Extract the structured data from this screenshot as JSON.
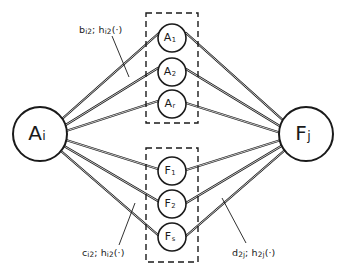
{
  "diagram": {
    "type": "node-link-graph",
    "background_color": "#ffffff",
    "stroke_color": "#1a1a1a",
    "source_node": {
      "id": "A_i",
      "base": "A",
      "subscript": "i",
      "cx": 40,
      "cy": 134,
      "r": 27
    },
    "sink_node": {
      "id": "F_j",
      "base": "F",
      "subscript": "j",
      "cx": 306,
      "cy": 134,
      "r": 27
    },
    "groups": [
      {
        "name": "a-group",
        "box": {
          "x": 146,
          "y": 13,
          "width": 52,
          "height": 110
        },
        "nodes": [
          {
            "id": "A_1",
            "base": "A",
            "subscript": "1",
            "cx": 172,
            "cy": 38,
            "r": 14
          },
          {
            "id": "A_2",
            "base": "A",
            "subscript": "2",
            "cx": 172,
            "cy": 72,
            "r": 14
          },
          {
            "id": "A_r",
            "base": "A",
            "subscript": "r",
            "cx": 172,
            "cy": 104,
            "r": 14
          }
        ]
      },
      {
        "name": "f-group",
        "box": {
          "x": 146,
          "y": 148,
          "width": 52,
          "height": 114
        },
        "nodes": [
          {
            "id": "F_1",
            "base": "F",
            "subscript": "1",
            "cx": 172,
            "cy": 171,
            "r": 14
          },
          {
            "id": "F_2",
            "base": "F",
            "subscript": "2",
            "cx": 172,
            "cy": 204,
            "r": 14
          },
          {
            "id": "F_s",
            "base": "F",
            "subscript": "s",
            "cx": 172,
            "cy": 237,
            "r": 14
          }
        ]
      }
    ],
    "annotations": [
      {
        "name": "b-annotation",
        "text": "b",
        "sub1": "i2",
        "mid": "; h",
        "sub2": "i2",
        "tail": "(·)",
        "x": 79,
        "y": 24,
        "leader": {
          "x1": 112,
          "y1": 36,
          "x2": 129,
          "y2": 77
        }
      },
      {
        "name": "c-annotation",
        "text": "c",
        "sub1": "i2",
        "mid": "; h",
        "sub2": "i2",
        "tail": "(·)",
        "x": 82,
        "y": 247,
        "leader": {
          "x1": 119,
          "y1": 245,
          "x2": 135,
          "y2": 203
        }
      },
      {
        "name": "d-annotation",
        "text": "d",
        "sub1": "2j",
        "mid": "; h",
        "sub2": "2j",
        "tail": "(·)",
        "x": 232,
        "y": 247,
        "leader": {
          "x1": 246,
          "y1": 243,
          "x2": 222,
          "y2": 198
        }
      }
    ],
    "edges": [
      {
        "name": "edge-ai-a1",
        "x1": 62,
        "y1": 119,
        "x2": 159,
        "y2": 33
      },
      {
        "name": "edge-ai-a2",
        "x1": 64,
        "y1": 126,
        "x2": 158,
        "y2": 68
      },
      {
        "name": "edge-ai-ar",
        "x1": 66,
        "y1": 131,
        "x2": 158,
        "y2": 101
      },
      {
        "name": "edge-ai-f1",
        "x1": 66,
        "y1": 140,
        "x2": 158,
        "y2": 169
      },
      {
        "name": "edge-ai-f2",
        "x1": 64,
        "y1": 146,
        "x2": 158,
        "y2": 201
      },
      {
        "name": "edge-ai-fs",
        "x1": 61,
        "y1": 151,
        "x2": 158,
        "y2": 235
      },
      {
        "name": "edge-a1-fj",
        "x1": 186,
        "y1": 33,
        "x2": 285,
        "y2": 122
      },
      {
        "name": "edge-a2-fj",
        "x1": 186,
        "y1": 69,
        "x2": 283,
        "y2": 128
      },
      {
        "name": "edge-ar-fj",
        "x1": 186,
        "y1": 103,
        "x2": 281,
        "y2": 133
      },
      {
        "name": "edge-f1-fj",
        "x1": 186,
        "y1": 170,
        "x2": 281,
        "y2": 140
      },
      {
        "name": "edge-f2-fj",
        "x1": 186,
        "y1": 203,
        "x2": 283,
        "y2": 145
      },
      {
        "name": "edge-fs-fj",
        "x1": 186,
        "y1": 236,
        "x2": 285,
        "y2": 150
      }
    ]
  }
}
